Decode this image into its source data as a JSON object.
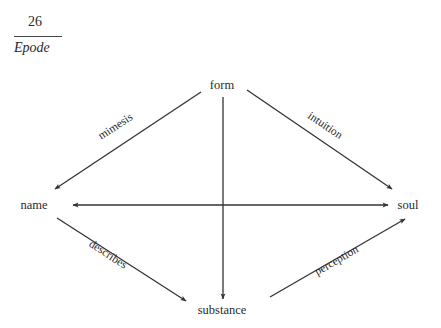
{
  "header": {
    "page_number": "26",
    "running_head": "Epode"
  },
  "diagram": {
    "nodes": {
      "form": "form",
      "name": "name",
      "soul": "soul",
      "substance": "substance"
    },
    "edges": [
      {
        "from": "form",
        "to": "name",
        "label": "mimesis"
      },
      {
        "from": "form",
        "to": "soul",
        "label": "intuition"
      },
      {
        "from": "form",
        "to": "substance",
        "label": ""
      },
      {
        "from": "soul",
        "to": "name",
        "label": "",
        "bidirectional": true
      },
      {
        "from": "name",
        "to": "substance",
        "label": "describes"
      },
      {
        "from": "substance",
        "to": "soul",
        "label": "perception"
      }
    ],
    "labels": {
      "mimesis": "mimesis",
      "intuition": "intuition",
      "describes": "describes",
      "perception": "perception"
    },
    "line_color": "#333333"
  }
}
